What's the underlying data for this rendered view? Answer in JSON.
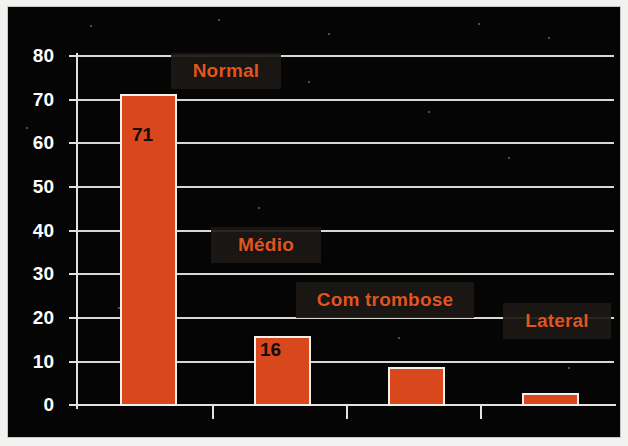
{
  "chart_data": {
    "type": "bar",
    "title": "",
    "subtitle": "",
    "xlabel": "",
    "ylabel": "",
    "ylim": [
      0,
      80
    ],
    "yticks": [
      0,
      10,
      20,
      30,
      40,
      50,
      60,
      70,
      80
    ],
    "grid": true,
    "legend_position": "none",
    "categories": [
      "Normal",
      "Médio",
      "Com trombose",
      "Lateral"
    ],
    "values": [
      71,
      16,
      9,
      3
    ],
    "data_labels": [
      "71",
      "16",
      "",
      ""
    ],
    "bar_color": "#d9481c",
    "bar_edge_color": "#f4f1ea",
    "background_color": "#050505",
    "grid_color": "#d8d8d4",
    "axis_color": "#e2e2de",
    "tick_label_color": "#ffffff",
    "annotation_text_color": "#e0561f",
    "annotation_box_color": "#1c1814"
  },
  "annotations": [
    {
      "text": "Normal",
      "x": 170,
      "y": 52,
      "w": 110,
      "h": 36
    },
    {
      "text": "Médio",
      "x": 210,
      "y": 226,
      "w": 110,
      "h": 36
    },
    {
      "text": "Com trombose",
      "x": 295,
      "y": 281,
      "w": 178,
      "h": 36
    },
    {
      "text": "Lateral",
      "x": 502,
      "y": 302,
      "w": 108,
      "h": 36
    }
  ],
  "axis": {
    "y_tick_labels": [
      "80",
      "70",
      "60",
      "50",
      "40",
      "30",
      "20",
      "10",
      "0"
    ]
  }
}
